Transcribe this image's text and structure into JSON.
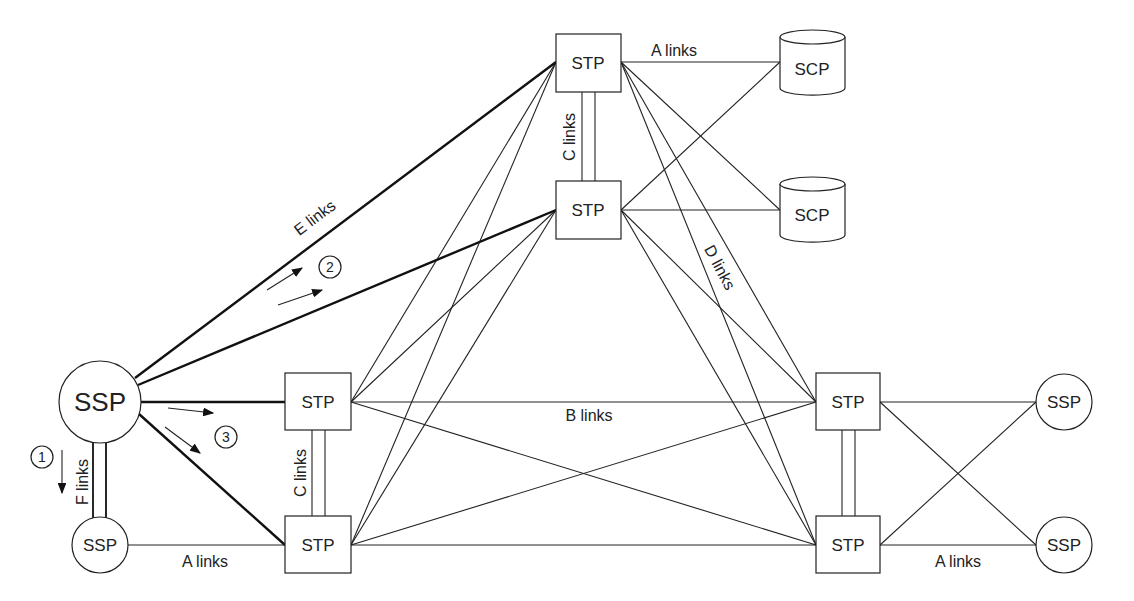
{
  "nodes": {
    "ssp_main": "SSP",
    "ssp_small": "SSP",
    "ssp_right_top": "SSP",
    "ssp_right_bottom": "SSP",
    "stp_top": "STP",
    "stp_upper": "STP",
    "stp_left_top": "STP",
    "stp_left_bottom": "STP",
    "stp_right_top": "STP",
    "stp_right_bottom": "STP",
    "scp_top": "SCP",
    "scp_bottom": "SCP"
  },
  "links": {
    "a_links_top": "A links",
    "a_links_left": "A links",
    "a_links_right": "A links",
    "b_links": "B links",
    "c_links_top": "C links",
    "c_links_left": "C links",
    "d_links": "D links",
    "e_links": "E links",
    "f_links": "F links"
  },
  "steps": [
    "1",
    "2",
    "3"
  ]
}
